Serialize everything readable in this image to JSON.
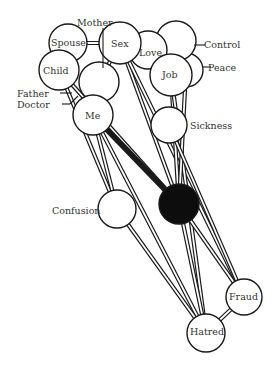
{
  "diagram": {
    "type": "network",
    "nodes": [
      {
        "id": "spouse",
        "label": "Spouse",
        "label_inside": true
      },
      {
        "id": "sex",
        "label": "Sex",
        "label_inside": true
      },
      {
        "id": "love",
        "label": "Love",
        "label_inside": true
      },
      {
        "id": "control",
        "label": "Control",
        "label_inside": false
      },
      {
        "id": "peace",
        "label": "Peace",
        "label_inside": false
      },
      {
        "id": "job",
        "label": "Job",
        "label_inside": true
      },
      {
        "id": "child",
        "label": "Child",
        "label_inside": true
      },
      {
        "id": "mother",
        "label": "Mother",
        "label_inside": false
      },
      {
        "id": "me",
        "label": "Me",
        "label_inside": true
      },
      {
        "id": "father",
        "label": "Father",
        "label_inside": false
      },
      {
        "id": "doctor",
        "label": "Doctor",
        "label_inside": false
      },
      {
        "id": "sickness",
        "label": "Sickness",
        "label_inside": false
      },
      {
        "id": "confusion",
        "label": "Confusion",
        "label_inside": false
      },
      {
        "id": "dark",
        "label": "",
        "filled": true
      },
      {
        "id": "fraud",
        "label": "Fraud",
        "label_inside": true
      },
      {
        "id": "hatred",
        "label": "Hatred",
        "label_inside": true
      }
    ],
    "edges": [
      {
        "from": "spouse",
        "to": "sex"
      },
      {
        "from": "love",
        "to": "control"
      },
      {
        "from": "child",
        "to": "confusion"
      },
      {
        "from": "child",
        "to": "dark"
      },
      {
        "from": "mother",
        "to": "sex"
      },
      {
        "from": "sex",
        "to": "dark"
      },
      {
        "from": "sex",
        "to": "fraud"
      },
      {
        "from": "me",
        "to": "dark",
        "strong": true
      },
      {
        "from": "me",
        "to": "confusion"
      },
      {
        "from": "me",
        "to": "hatred"
      },
      {
        "from": "job",
        "to": "dark"
      },
      {
        "from": "job",
        "to": "hatred"
      },
      {
        "from": "peace",
        "to": "dark"
      },
      {
        "from": "sickness",
        "to": "fraud"
      },
      {
        "from": "confusion",
        "to": "hatred"
      },
      {
        "from": "dark",
        "to": "hatred"
      },
      {
        "from": "dark",
        "to": "fraud"
      },
      {
        "from": "fraud",
        "to": "hatred"
      }
    ]
  },
  "labels": {
    "mother": "Mother",
    "spouse": "Spouse",
    "sex": "Sex",
    "love": "Love",
    "control": "Control",
    "peace": "Peace",
    "job": "Job",
    "child": "Child",
    "father": "Father",
    "doctor": "Doctor",
    "me": "Me",
    "sickness": "Sickness",
    "confusion": "Confusion",
    "fraud": "Fraud",
    "hatred": "Hatred"
  }
}
